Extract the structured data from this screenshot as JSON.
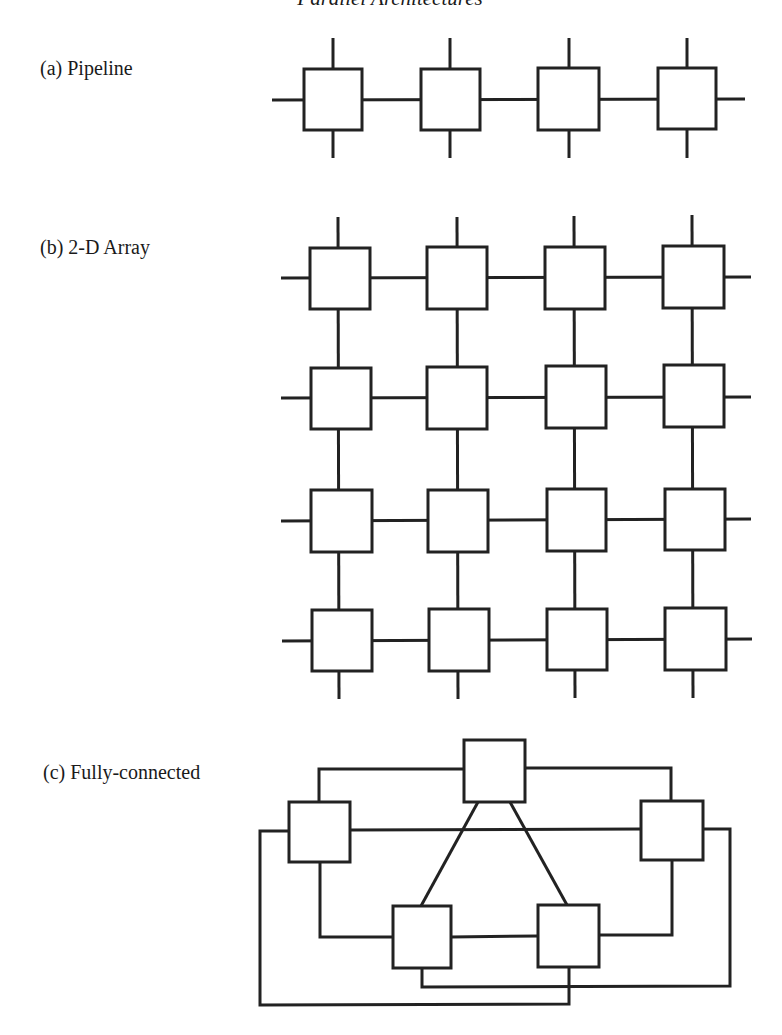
{
  "page": {
    "title": "Parallel Architectures"
  },
  "sections": [
    {
      "id": "pipeline",
      "label": "(a) Pipeline",
      "topology": "linear",
      "node_count": 4,
      "rows": 1,
      "cols": 4
    },
    {
      "id": "array2d",
      "label": "(b) 2-D Array",
      "topology": "mesh",
      "node_count": 16,
      "rows": 4,
      "cols": 4
    },
    {
      "id": "fully_connected",
      "label": "(c) Fully-connected",
      "topology": "complete",
      "node_count": 5
    }
  ],
  "colors": {
    "stroke": "#222222",
    "background": "#ffffff",
    "text": "#1a1a1a"
  }
}
